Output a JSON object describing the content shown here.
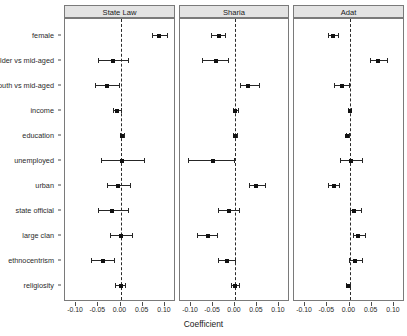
{
  "chart_data": {
    "type": "scatter",
    "title": "",
    "xlabel": "Coefficient",
    "ylabel": "",
    "xlim": [
      -0.125,
      0.125
    ],
    "xticks": [
      -0.1,
      -0.05,
      0.0,
      0.05,
      0.1
    ],
    "xticklabels": [
      "-0.10",
      "-0.05",
      "0.00",
      "0.05",
      "0.10"
    ],
    "grid": false,
    "legend": "none",
    "reference_line": 0.0,
    "reference_line_style": "dashed",
    "categories": [
      "female",
      "older vs mid-aged",
      "youth vs mid-aged",
      "income",
      "education",
      "unemployed",
      "urban",
      "state official",
      "large clan",
      "ethnocentrism",
      "religiosity"
    ],
    "panels": [
      {
        "label": "State Law",
        "estimates": [
          0.086,
          -0.018,
          -0.03,
          -0.007,
          0.003,
          0.004,
          -0.005,
          -0.019,
          0.002,
          -0.04,
          0.0
        ],
        "ci_low": [
          0.072,
          -0.051,
          -0.057,
          -0.016,
          -0.002,
          -0.045,
          -0.03,
          -0.051,
          -0.024,
          -0.066,
          -0.012
        ],
        "ci_high": [
          0.104,
          0.018,
          -0.004,
          0.001,
          0.008,
          0.054,
          0.021,
          0.016,
          0.027,
          -0.014,
          0.011
        ]
      },
      {
        "label": "Sharia",
        "estimates": [
          -0.037,
          -0.043,
          0.03,
          0.001,
          0.0,
          -0.05,
          0.048,
          -0.014,
          -0.062,
          -0.018,
          0.0
        ],
        "ci_low": [
          -0.054,
          -0.074,
          0.012,
          -0.004,
          -0.004,
          -0.107,
          0.031,
          -0.038,
          -0.086,
          -0.039,
          -0.009
        ],
        "ci_high": [
          -0.022,
          -0.016,
          0.055,
          0.006,
          0.004,
          -0.002,
          0.068,
          0.008,
          -0.041,
          0.001,
          0.009
        ]
      },
      {
        "label": "Adat",
        "estimates": [
          -0.037,
          0.065,
          -0.018,
          0.0,
          -0.005,
          0.003,
          -0.035,
          0.011,
          0.02,
          0.013,
          -0.004
        ],
        "ci_low": [
          -0.048,
          0.046,
          -0.034,
          -0.003,
          -0.008,
          -0.022,
          -0.049,
          0.0,
          0.007,
          -0.001,
          -0.009
        ],
        "ci_high": [
          -0.026,
          0.085,
          -0.001,
          0.004,
          -0.002,
          0.028,
          -0.023,
          0.026,
          0.035,
          0.029,
          0.001
        ]
      }
    ]
  },
  "style": {
    "strip_background": "#e3e3e3",
    "border_color": "#7a7a7a",
    "point_color": "#111111",
    "line_color": "#262626"
  }
}
